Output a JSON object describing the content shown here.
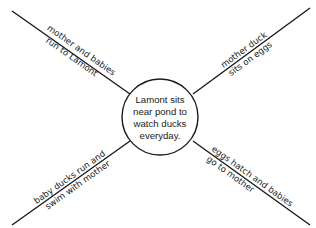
{
  "diagram": {
    "type": "spider-map",
    "center": {
      "lines": [
        "Lamont sits",
        "near pond to",
        "watch ducks",
        "everyday."
      ]
    },
    "spokes": [
      {
        "position": "top-left",
        "line1": "mother and babies",
        "line2": "run to Lamont"
      },
      {
        "position": "top-right",
        "line1": "mother duck",
        "line2": "sits on eggs"
      },
      {
        "position": "bottom-left",
        "line1": "baby ducks run and",
        "line2": "swim with mother"
      },
      {
        "position": "bottom-right",
        "line1": "eggs hatch and babies",
        "line2": "go to mother"
      }
    ],
    "colors": {
      "stroke": "#1a1a1a",
      "background": "#ffffff"
    }
  }
}
